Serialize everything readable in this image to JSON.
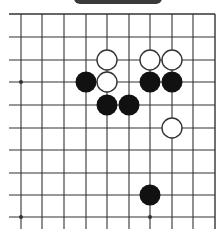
{
  "board": {
    "line_color": "#333333",
    "background": "#ffffff",
    "col_x": [
      21,
      42,
      64,
      86,
      107,
      129,
      150,
      172,
      193,
      215
    ],
    "row_y": [
      14,
      37,
      60,
      82,
      105,
      128,
      150,
      173,
      195,
      217
    ],
    "line_left": 9,
    "line_right": 215,
    "line_top": 14,
    "line_bottom": 229,
    "stone_radius": 10.5,
    "star_points": [
      {
        "col": 0,
        "row": 3
      },
      {
        "col": 0,
        "row": 9
      },
      {
        "col": 6,
        "row": 9
      }
    ],
    "stones": [
      {
        "color": "white",
        "col": 4,
        "row": 2
      },
      {
        "color": "white",
        "col": 6,
        "row": 2
      },
      {
        "color": "white",
        "col": 7,
        "row": 2
      },
      {
        "color": "black",
        "col": 3,
        "row": 3
      },
      {
        "color": "white",
        "col": 4,
        "row": 3
      },
      {
        "color": "black",
        "col": 6,
        "row": 3
      },
      {
        "color": "black",
        "col": 7,
        "row": 3
      },
      {
        "color": "black",
        "col": 4,
        "row": 4
      },
      {
        "color": "black",
        "col": 5,
        "row": 4
      },
      {
        "color": "white",
        "col": 7,
        "row": 5
      },
      {
        "color": "black",
        "col": 6,
        "row": 8
      }
    ]
  },
  "colors": {
    "black_stone": "#111111",
    "white_stone_fill": "#ffffff",
    "white_stone_stroke": "#333333",
    "top_tab": "#3a3a3a"
  }
}
